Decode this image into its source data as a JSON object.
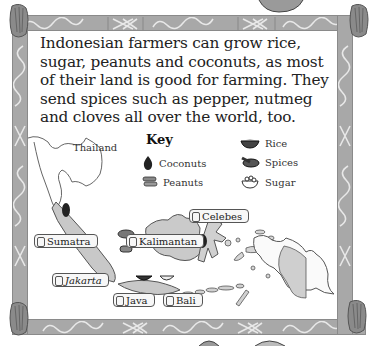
{
  "intro_text": "Indonesian farmers can grow rice, sugar, peanuts and coconuts, as most of their land is good for farming. They send spices such as pepper, nutmeg and cloves all over the world, too.",
  "key": {
    "title": "Key",
    "items": [
      {
        "label": "Coconuts",
        "icon": "coconut-icon"
      },
      {
        "label": "Peanuts",
        "icon": "peanuts-icon"
      },
      {
        "label": "Rice",
        "icon": "rice-bowl-icon"
      },
      {
        "label": "Spices",
        "icon": "spices-mortar-icon"
      },
      {
        "label": "Sugar",
        "icon": "sugar-bowl-icon"
      }
    ]
  },
  "map": {
    "country_label": "Thailand",
    "scroll_labels": [
      {
        "label": "Sumatra"
      },
      {
        "label": "Kalimantan"
      },
      {
        "label": "Celebes"
      },
      {
        "label": "Jakarta"
      },
      {
        "label": "Java"
      },
      {
        "label": "Bali"
      }
    ]
  },
  "colors": {
    "frame": "#a8a8a8",
    "land_fill": "#c8c8c8",
    "outline": "#555555",
    "text": "#222222"
  }
}
